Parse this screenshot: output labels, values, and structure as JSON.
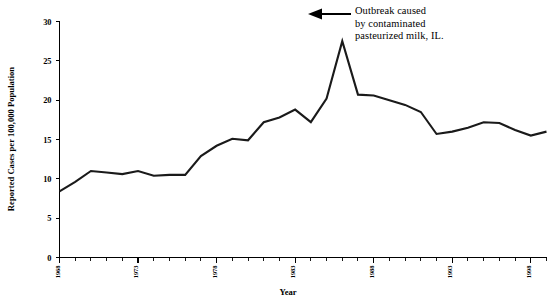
{
  "chart_data": {
    "type": "line",
    "title": "",
    "xlabel": "Year",
    "ylabel": "Reported Cases per 100,000 Population",
    "xlim": [
      1968,
      1999
    ],
    "ylim": [
      0,
      30
    ],
    "ytick_labels": [
      "0",
      "5",
      "10",
      "15",
      "20",
      "25",
      "30"
    ],
    "ytick_values": [
      0,
      5,
      10,
      15,
      20,
      25,
      30
    ],
    "xtick_labels": [
      "1968",
      "1973",
      "1978",
      "1983",
      "1988",
      "1993",
      "1998"
    ],
    "xtick_values": [
      1968,
      1973,
      1978,
      1983,
      1988,
      1993,
      1998
    ],
    "grid": false,
    "legend": "none",
    "x": [
      1968,
      1969,
      1970,
      1971,
      1972,
      1973,
      1974,
      1975,
      1976,
      1977,
      1978,
      1979,
      1980,
      1981,
      1982,
      1983,
      1984,
      1985,
      1986,
      1987,
      1988,
      1989,
      1990,
      1991,
      1992,
      1993,
      1994,
      1995,
      1996,
      1997,
      1998,
      1999
    ],
    "values": [
      8.4,
      9.6,
      11.0,
      10.8,
      10.6,
      11.0,
      10.4,
      10.5,
      10.5,
      12.9,
      14.2,
      15.1,
      14.9,
      17.2,
      17.8,
      18.8,
      17.2,
      20.2,
      27.5,
      20.7,
      20.6,
      20.0,
      19.4,
      18.5,
      15.7,
      16.0,
      16.5,
      17.2,
      17.1,
      16.2,
      15.5,
      16.0
    ],
    "series": [
      {
        "name": "Reported Cases per 100,000 Population",
        "values": [
          8.4,
          9.6,
          11.0,
          10.8,
          10.6,
          11.0,
          10.4,
          10.5,
          10.5,
          12.9,
          14.2,
          15.1,
          14.9,
          17.2,
          17.8,
          18.8,
          17.2,
          20.2,
          27.5,
          20.7,
          20.6,
          20.0,
          19.4,
          18.5,
          15.7,
          16.0,
          16.5,
          17.2,
          17.1,
          16.2,
          15.5,
          16.0
        ]
      }
    ],
    "annotations": [
      {
        "name": "outbreak-annotation",
        "line1": "Outbreak caused",
        "line2": "by contaminated",
        "line3": "pasteurized milk, IL.",
        "arrow": "left-arrow",
        "points_to_x": 1986,
        "points_to_value": 27.5
      }
    ],
    "line_color": "#1a1a1a",
    "axis_color": "#000000",
    "background_color": "#ffffff"
  }
}
